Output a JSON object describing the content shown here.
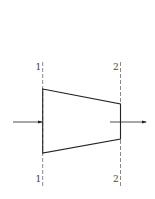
{
  "diagram": {
    "type": "nozzle-cross-section",
    "sections": [
      {
        "id": "section-1",
        "top_label": "1",
        "bottom_label": "1"
      },
      {
        "id": "section-2",
        "top_label": "2",
        "bottom_label": "2"
      }
    ],
    "flow": {
      "inlet_arrow": "right-arrow",
      "outlet_arrow": "right-arrow"
    },
    "colors": {
      "stroke": "#222222",
      "dash": "#555555",
      "label": "#444444"
    }
  }
}
